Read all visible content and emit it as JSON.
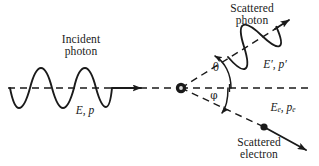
{
  "figure": {
    "type": "physics-diagram",
    "background_color": "#ffffff",
    "stroke_color": "#1a1a1a",
    "labels": {
      "incident_photon": "Incident\nphoton",
      "incident_photon_line1": "Incident",
      "incident_photon_line2": "photon",
      "incident_energy_momentum": "E, p",
      "scattered_photon_line1": "Scattered",
      "scattered_photon_line2": "photon",
      "scattered_photon_energy_momentum": "E′, p′",
      "scattered_electron_line1": "Scattered",
      "scattered_electron_line2": "electron",
      "electron_energy_symbol": "E",
      "electron_energy_subscript": "e",
      "electron_momentum_symbol": "p",
      "electron_momentum_subscript": "e",
      "separator": ", ",
      "photon_scatter_angle": "θ",
      "electron_scatter_angle": "φ"
    },
    "geometry": {
      "vertex": {
        "x": 181,
        "y": 88
      },
      "incident_axis_y": 88,
      "incident_wave_start_x": 10,
      "incident_wave_end_x": 112,
      "incident_arrow_tip_x": 146,
      "photon_angle_deg": 32,
      "electron_angle_deg": 25,
      "photon_arrow_tip": {
        "x": 293,
        "y": 17
      },
      "electron_dot": {
        "x": 264,
        "y": 127
      },
      "electron_arrow_tip": {
        "x": 311,
        "y": 153
      },
      "wave_amplitude_px": 20,
      "scattered_wave_amplitude_px": 13
    }
  }
}
